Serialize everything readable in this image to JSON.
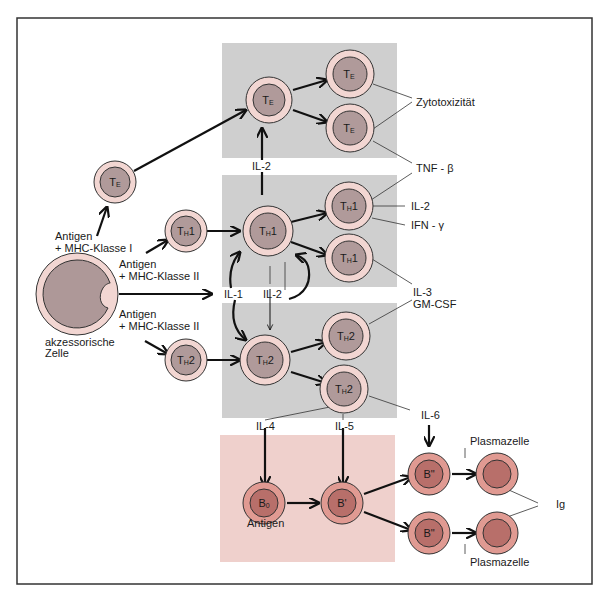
{
  "colors": {
    "frame": "#333333",
    "gray_box": "#cfcfcf",
    "pink_box": "#efd0cc",
    "t_cell_outer": "#f2d6d2",
    "t_cell_inner": "#b09a9a",
    "b_cell_outer": "#e09a92",
    "b_cell_inner": "#b86f6a",
    "acc_outer": "#f2d6d2",
    "acc_inner": "#ae9898"
  },
  "cells": {
    "te_left": {
      "main": "T",
      "sub": "E",
      "suffix": ""
    },
    "te_center": {
      "main": "T",
      "sub": "E",
      "suffix": ""
    },
    "te_top_right": {
      "main": "T",
      "sub": "E",
      "suffix": ""
    },
    "te_bottom_right": {
      "main": "T",
      "sub": "E",
      "suffix": ""
    },
    "th1_left": {
      "main": "T",
      "sub": "H",
      "suffix": "1"
    },
    "th1_center": {
      "main": "T",
      "sub": "H",
      "suffix": "1"
    },
    "th1_top_right": {
      "main": "T",
      "sub": "H",
      "suffix": "1"
    },
    "th1_bottom_right": {
      "main": "T",
      "sub": "H",
      "suffix": "1"
    },
    "th2_left": {
      "main": "T",
      "sub": "H",
      "suffix": "2"
    },
    "th2_center": {
      "main": "T",
      "sub": "H",
      "suffix": "2"
    },
    "th2_top_right": {
      "main": "T",
      "sub": "H",
      "suffix": "2"
    },
    "th2_bottom_right": {
      "main": "T",
      "sub": "H",
      "suffix": "2"
    },
    "b0": {
      "main": "B",
      "sub": "0",
      "suffix": ""
    },
    "b_prime": {
      "main": "B'",
      "sub": "",
      "suffix": ""
    },
    "b_double_top": {
      "main": "B\"",
      "sub": "",
      "suffix": ""
    },
    "b_double_bottom": {
      "main": "B\"",
      "sub": "",
      "suffix": ""
    }
  },
  "labels": {
    "antigen_mhc1_line1": "Antigen",
    "antigen_mhc1_line2": "+ MHC-Klasse I",
    "antigen_mhc2a_line1": "Antigen",
    "antigen_mhc2a_line2": "+ MHC-Klasse II",
    "antigen_mhc2b_line1": "Antigen",
    "antigen_mhc2b_line2": "+ MHC-Klasse II",
    "accessory_line1": "akzessorische",
    "accessory_line2": "Zelle",
    "il1": "IL-1",
    "il2_top": "IL-2",
    "il2_mid": "IL-2",
    "il4": "IL-4",
    "il5": "IL-5",
    "il6": "IL-6",
    "zytotox": "Zytotoxizität",
    "tnf": "TNF - β",
    "il2_right": "IL-2",
    "ifn": "IFN - γ",
    "il3": "IL-3",
    "gmcsf": "GM-CSF",
    "antigen_b0": "Antigen",
    "plasma_top": "Plasmazelle",
    "plasma_bottom": "Plasmazelle",
    "ig": "Ig"
  }
}
